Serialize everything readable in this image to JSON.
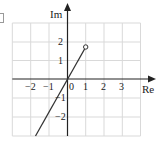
{
  "figure": {
    "type": "argand-diagram",
    "axes": {
      "x_label": "Re",
      "y_label": "Im",
      "origin_label": "0",
      "x_ticks": [
        "−2",
        "−1",
        "1",
        "2",
        "3"
      ],
      "y_ticks": [
        "2",
        "1",
        "−1",
        "−2"
      ]
    },
    "grid": {
      "x_range": [
        -3,
        4
      ],
      "y_range": [
        -3,
        3
      ],
      "cell": 1,
      "color": "#d9d9d9"
    },
    "ray": {
      "start_point": {
        "re": 1,
        "im": 1.73,
        "marker": "open-circle"
      },
      "direction": "through origin toward lower-left",
      "end_point": {
        "re": -1.75,
        "im": -3
      },
      "color": "#333333"
    },
    "colors": {
      "axis": "#222222",
      "grid": "#d9d9d9",
      "line": "#333333"
    }
  }
}
